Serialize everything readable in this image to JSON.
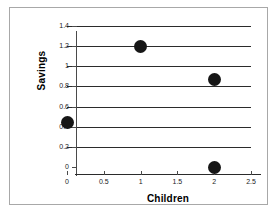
{
  "chart_data": {
    "type": "scatter",
    "title": "",
    "xlabel": "Children",
    "ylabel": "Savings",
    "xlim": [
      0,
      2.5
    ],
    "ylim": [
      0,
      1.4
    ],
    "grid": true,
    "legend": "none",
    "xticks": [
      "0",
      "0.5",
      "1",
      "1.5",
      "2",
      "2.5"
    ],
    "xtick_values": [
      0,
      0.5,
      1,
      1.5,
      2,
      2.5
    ],
    "yticks": [
      "0",
      "0.2",
      "0.4",
      "0.6",
      "0.8",
      "1",
      "1.2",
      "1.4"
    ],
    "ytick_values": [
      0,
      0.2,
      0.4,
      0.6,
      0.8,
      1.0,
      1.2,
      1.4
    ],
    "points": [
      {
        "x": 0,
        "y": 0.44
      },
      {
        "x": 1,
        "y": 1.2
      },
      {
        "x": 2,
        "y": 0.87
      },
      {
        "x": 2,
        "y": 0.0
      }
    ],
    "marker_color": "#161616",
    "marker_shape": "circle"
  },
  "frame": {
    "border_color": "#a8a8a8",
    "background": "#ffffff"
  }
}
